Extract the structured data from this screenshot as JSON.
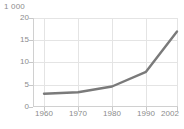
{
  "chart_data": {
    "type": "line",
    "title": "",
    "subtitle": "",
    "unit_label": "1 000",
    "xlabel": "",
    "ylabel": "",
    "x": [
      1960,
      1970,
      1980,
      1990,
      2002
    ],
    "categories": [
      "1960",
      "1970",
      "1980",
      "1990",
      "2002"
    ],
    "series": [
      {
        "name": "",
        "values": [
          3.0,
          3.3,
          4.6,
          7.9,
          17.0
        ],
        "color": "#7a7a7a"
      }
    ],
    "xlim": [
      1960,
      2002
    ],
    "ylim": [
      0,
      20
    ],
    "ytick_labels": [
      "0",
      "5",
      "10",
      "15",
      "20"
    ],
    "ytick_values": [
      0,
      5,
      10,
      15,
      20
    ],
    "xtick_labels": [
      "1960",
      "1970",
      "1980",
      "1990",
      "2002"
    ],
    "grid": "both",
    "grid_color": "#e4e4e4",
    "legend": "none",
    "background": "#ffffff",
    "text_color": "#8c8c8c"
  }
}
